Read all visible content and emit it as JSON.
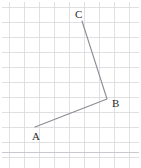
{
  "figure": {
    "title": "",
    "canvas": {
      "width": 141,
      "height": 168,
      "background": "#ffffff"
    },
    "grid": {
      "spacing": 15,
      "origin_x": 9,
      "origin_y": 7,
      "color": "#d8d8dc",
      "line_width": 0.8,
      "x_lines": [
        9,
        24,
        39,
        54,
        69,
        84,
        99,
        114,
        129
      ],
      "y_lines": [
        7,
        22,
        37,
        52,
        67,
        82,
        97,
        112,
        127,
        142,
        157
      ],
      "x_min": 2,
      "x_max": 139,
      "y_min": 2,
      "y_max": 168
    },
    "separator": {
      "name": "panel-bottom-border",
      "y": 152,
      "color": "#c9c9cf",
      "line_width": 1
    },
    "shape": {
      "type": "polyline",
      "stroke": "#8c8c94",
      "stroke_width": 1.1,
      "points": "35,127 107,99 82,21"
    },
    "points": [
      {
        "id": "A",
        "label": "A",
        "x": 35,
        "y": 127,
        "label_x": 32,
        "label_y": 140
      },
      {
        "id": "B",
        "label": "B",
        "x": 107,
        "y": 99,
        "label_x": 112,
        "label_y": 107
      },
      {
        "id": "C",
        "label": "C",
        "x": 82,
        "y": 21,
        "label_x": 75,
        "label_y": 18
      }
    ],
    "segments": [
      {
        "from": "A",
        "to": "B"
      },
      {
        "from": "B",
        "to": "C"
      }
    ]
  }
}
